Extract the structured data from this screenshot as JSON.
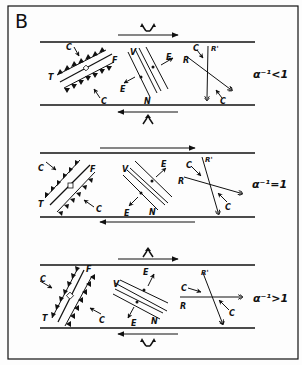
{
  "figure": {
    "panel_label": "B",
    "colors": {
      "ink": "#111111",
      "background": "#fdfdfd"
    }
  },
  "panels": [
    {
      "condition": "α⁻¹<1",
      "top_shear": "dextral (arrow right)",
      "bottom_shear": "sinistral (arrow left)",
      "top_marker": "extension (divergent arrows)",
      "bottom_marker": "compression (convergent arrows)",
      "thrust": {
        "T": "T",
        "F": "F",
        "C_top": "C",
        "C_bottom": "C"
      },
      "vein": {
        "V": "V",
        "N": "N",
        "E_top": "E",
        "E_bottom": "E"
      },
      "riedel": {
        "R": "R",
        "R_prime": "R'",
        "C_top": "C",
        "C_bottom": "C"
      }
    },
    {
      "condition": "α⁻¹=1",
      "top_shear": "dextral (arrow right)",
      "bottom_shear": "sinistral (arrow left)",
      "thrust": {
        "T": "T",
        "F": "F",
        "C_top": "C",
        "C_bottom": "C"
      },
      "vein": {
        "V": "V",
        "N": "N",
        "E_top": "E",
        "E_bottom": "E"
      },
      "riedel": {
        "R": "R",
        "R_prime": "R'",
        "C_top": "C",
        "C_bottom": "C"
      }
    },
    {
      "condition": "α⁻¹>1",
      "top_shear": "dextral (arrow right)",
      "bottom_shear": "sinistral (arrow left)",
      "top_marker": "compression (convergent arrows)",
      "bottom_marker": "extension (divergent arrows)",
      "thrust": {
        "T": "T",
        "F": "F",
        "C_top": "C",
        "C_bottom": "C"
      },
      "vein": {
        "V": "V",
        "N": "N",
        "E_top": "E",
        "E_bottom": "E"
      },
      "riedel": {
        "R": "R",
        "R_prime": "R'",
        "C_top": "C",
        "C_bottom": "C"
      }
    }
  ],
  "labels": {
    "B": "B",
    "T": "T",
    "F": "F",
    "C": "C",
    "V": "V",
    "N": "N",
    "E": "E",
    "R": "R",
    "Rp": "R'",
    "cond1": "α⁻¹<1",
    "cond2": "α⁻¹=1",
    "cond3": "α⁻¹>1"
  }
}
